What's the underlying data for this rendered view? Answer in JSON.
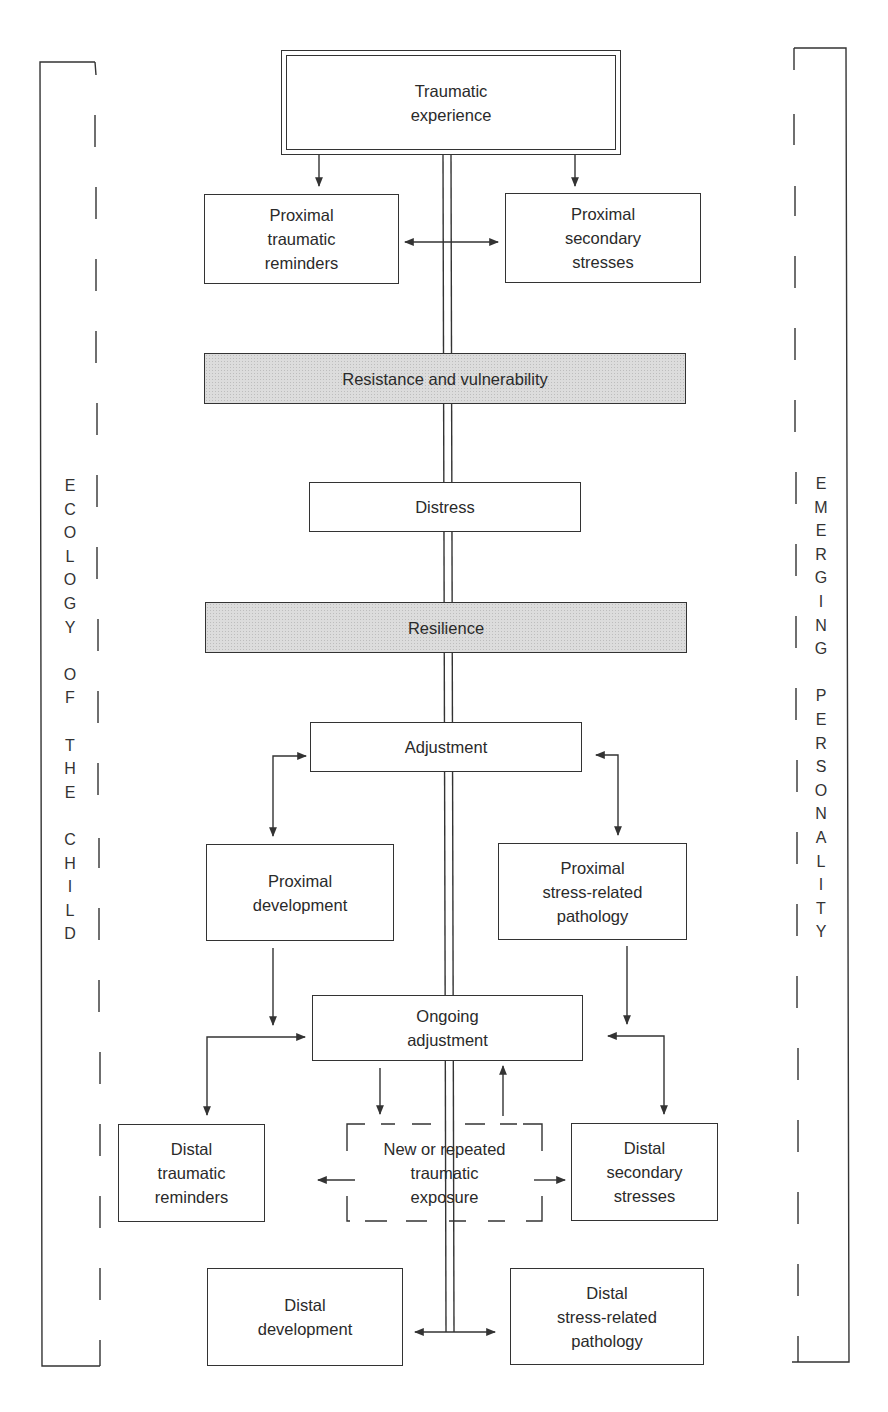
{
  "diagram": {
    "nodes": {
      "traumatic_experience": {
        "line1": "Traumatic",
        "line2": "experience"
      },
      "proximal_traumatic_reminders": {
        "line1": "Proximal",
        "line2": "traumatic",
        "line3": "reminders"
      },
      "proximal_secondary_stresses": {
        "line1": "Proximal",
        "line2": "secondary",
        "line3": "stresses"
      },
      "resistance_vulnerability": {
        "label": "Resistance and vulnerability"
      },
      "distress": {
        "label": "Distress"
      },
      "resilience": {
        "label": "Resilience"
      },
      "adjustment": {
        "label": "Adjustment"
      },
      "proximal_development": {
        "line1": "Proximal",
        "line2": "development"
      },
      "proximal_pathology": {
        "line1": "Proximal",
        "line2": "stress-related",
        "line3": "pathology"
      },
      "ongoing_adjustment": {
        "line1": "Ongoing",
        "line2": "adjustment"
      },
      "distal_traumatic_reminders": {
        "line1": "Distal",
        "line2": "traumatic",
        "line3": "reminders"
      },
      "new_repeated_exposure": {
        "line1": "New or repeated",
        "line2": "traumatic",
        "line3": "exposure"
      },
      "distal_secondary_stresses": {
        "line1": "Distal",
        "line2": "secondary",
        "line3": "stresses"
      },
      "distal_development": {
        "line1": "Distal",
        "line2": "development"
      },
      "distal_pathology": {
        "line1": "Distal",
        "line2": "stress-related",
        "line3": "pathology"
      }
    },
    "side_labels": {
      "left": {
        "words": [
          "ECOLOGY",
          "OF",
          "THE",
          "CHILD"
        ],
        "letters": [
          "E",
          "C",
          "O",
          "L",
          "O",
          "G",
          "Y",
          "",
          "O",
          "F",
          "",
          "T",
          "H",
          "E",
          "",
          "C",
          "H",
          "I",
          "L",
          "D"
        ]
      },
      "right": {
        "words": [
          "EMERGING",
          "PERSONALITY"
        ],
        "letters": [
          "E",
          "M",
          "E",
          "R",
          "G",
          "I",
          "N",
          "G",
          "",
          "P",
          "E",
          "R",
          "S",
          "O",
          "N",
          "A",
          "L",
          "I",
          "T",
          "Y"
        ]
      }
    },
    "colors": {
      "line": "#333333",
      "shaded_fill": "#d8d8d8",
      "background": "#ffffff"
    }
  }
}
